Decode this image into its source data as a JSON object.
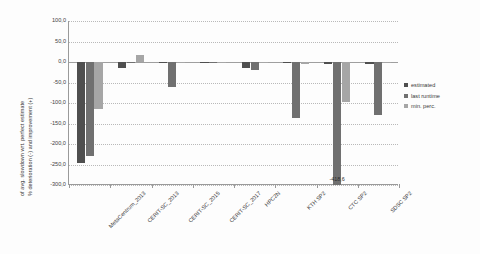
{
  "chart_data": {
    "type": "bar",
    "title": "",
    "subtitle": "",
    "xlabel": "",
    "ylabel_line1": "% deterioration (-) and improvement (+)",
    "ylabel_line2": "of  avg. slowdown wrt. perfect estimate",
    "ylim": [
      -300.0,
      100.0
    ],
    "ytick_labels": [
      "100,0",
      "50,0",
      "0,0",
      "-50,0",
      "-100,0",
      "-150,0",
      "-200,0",
      "-250,0",
      "-300,0"
    ],
    "ytick_values": [
      100,
      50,
      0,
      -50,
      -100,
      -150,
      -200,
      -250,
      -300
    ],
    "grid": true,
    "legend_position": "right",
    "categories": [
      "MetaCentrum_2013",
      "CERIT-SC_2013",
      "CERIT-SC_2015",
      "CERIT-SC_2017",
      "HPC2N",
      "KTH SP2",
      "CTC SP2",
      "SDSC SP2"
    ],
    "series": [
      {
        "name": "estimated",
        "color": "#4f4f4f",
        "values": [
          -247.0,
          -15.0,
          -3.0,
          -2.0,
          -15.0,
          -3.0,
          -5.0,
          -4.0
        ]
      },
      {
        "name": "last runtime",
        "color": "#707070",
        "values": [
          -230.0,
          -3.0,
          -60.0,
          -1.0,
          -20.0,
          -136.0,
          -418.6,
          -130.0
        ]
      },
      {
        "name": "min. perc.",
        "color": "#a6a6a6",
        "values": [
          -115.0,
          18.0,
          -1.0,
          -1.0,
          -2.0,
          -4.0,
          -98.0,
          -3.0
        ]
      }
    ],
    "data_labels": [
      {
        "category": "CTC SP2",
        "series": "last runtime",
        "text": "-418,6"
      }
    ]
  }
}
